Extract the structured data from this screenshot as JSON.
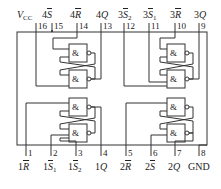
{
  "chip": {
    "description": "Quad SR latch pin diagram",
    "top_pins": [
      {
        "num": "16",
        "label": "V",
        "sub": "CC",
        "bar": false
      },
      {
        "num": "15",
        "label": "4S",
        "sub": "",
        "bar": true
      },
      {
        "num": "14",
        "label": "4R",
        "sub": "",
        "bar": true
      },
      {
        "num": "13",
        "label": "4Q",
        "sub": "",
        "bar": false
      },
      {
        "num": "12",
        "label": "3S",
        "sub": "2",
        "bar": true
      },
      {
        "num": "11",
        "label": "3S",
        "sub": "1",
        "bar": true
      },
      {
        "num": "10",
        "label": "3R",
        "sub": "",
        "bar": true
      },
      {
        "num": "9",
        "label": "3Q",
        "sub": "",
        "bar": false
      }
    ],
    "bottom_pins": [
      {
        "num": "1",
        "label": "1R",
        "sub": "",
        "bar": true
      },
      {
        "num": "2",
        "label": "1S",
        "sub": "1",
        "bar": true
      },
      {
        "num": "3",
        "label": "1S",
        "sub": "2",
        "bar": true
      },
      {
        "num": "4",
        "label": "1Q",
        "sub": "",
        "bar": false
      },
      {
        "num": "5",
        "label": "2R",
        "sub": "",
        "bar": true
      },
      {
        "num": "6",
        "label": "2S",
        "sub": "",
        "bar": true
      },
      {
        "num": "7",
        "label": "2Q",
        "sub": "",
        "bar": false
      },
      {
        "num": "8",
        "label": "GND",
        "sub": "",
        "bar": false
      }
    ],
    "gate_symbol": "&",
    "gates_count": 8
  }
}
